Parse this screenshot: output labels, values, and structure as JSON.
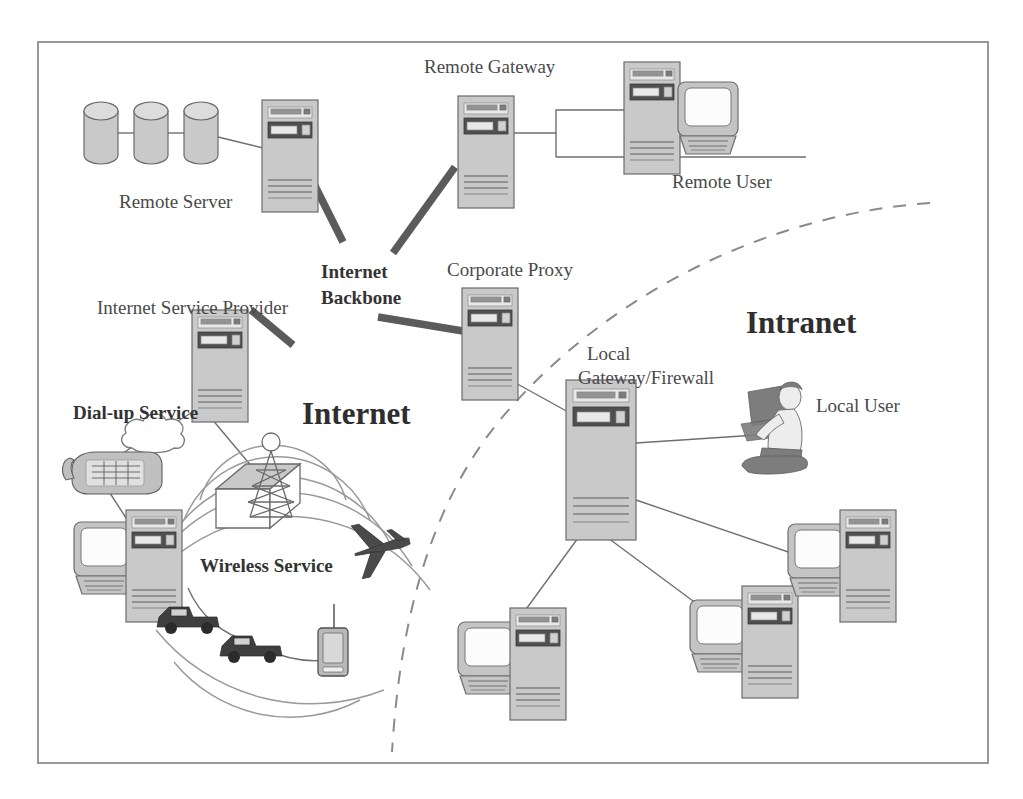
{
  "diagram": {
    "zones": [
      {
        "id": "internet",
        "label": "Internet"
      },
      {
        "id": "intranet",
        "label": "Intranet"
      }
    ],
    "labels": {
      "remote_server": "Remote Server",
      "remote_gateway": "Remote Gateway",
      "remote_user": "Remote User",
      "internet_backbone": "Internet",
      "internet_backbone2": "Backbone",
      "corporate_proxy": "Corporate Proxy",
      "isp": "Internet Service Provider",
      "dialup": "Dial-up Service",
      "wireless": "Wireless Service",
      "local_gateway": "Local",
      "local_gateway2": "Gateway/Firewall",
      "local_user": "Local User",
      "internet_zone": "Internet",
      "intranet_zone": "Intranet"
    },
    "nodes": [
      {
        "id": "disk-array",
        "name": "disk-array",
        "label": "Remote Server",
        "count": 3
      },
      {
        "id": "remote-server-tower",
        "name": "server-tower",
        "label": "Remote Server"
      },
      {
        "id": "remote-gateway-tower",
        "name": "server-tower",
        "label": "Remote Gateway"
      },
      {
        "id": "remote-user-workstation",
        "name": "workstation",
        "label": "Remote User"
      },
      {
        "id": "corporate-proxy-tower",
        "name": "server-tower",
        "label": "Corporate Proxy"
      },
      {
        "id": "isp-tower",
        "name": "server-tower",
        "label": "Internet Service Provider"
      },
      {
        "id": "dialup-cloud",
        "name": "cloud",
        "label": "Dial-up Service"
      },
      {
        "id": "telephone",
        "name": "telephone",
        "label": "Dial-up Service"
      },
      {
        "id": "dialup-workstation",
        "name": "workstation",
        "label": "Dial-up Service"
      },
      {
        "id": "radio-tower",
        "name": "radio-tower",
        "label": "Wireless Service"
      },
      {
        "id": "airplane",
        "name": "airplane",
        "label": "Wireless Service"
      },
      {
        "id": "vehicle-1",
        "name": "vehicle",
        "label": "Wireless Service"
      },
      {
        "id": "vehicle-2",
        "name": "vehicle",
        "label": "Wireless Service"
      },
      {
        "id": "mobile-phone",
        "name": "mobile-phone",
        "label": "Wireless Service"
      },
      {
        "id": "local-gateway-tower",
        "name": "firewall-tower",
        "label": "Local Gateway/Firewall"
      },
      {
        "id": "local-user-person",
        "name": "person-at-desk",
        "label": "Local User"
      },
      {
        "id": "intranet-workstation-1",
        "name": "workstation",
        "label": ""
      },
      {
        "id": "intranet-workstation-2",
        "name": "workstation",
        "label": ""
      },
      {
        "id": "intranet-workstation-3",
        "name": "workstation",
        "label": ""
      }
    ],
    "colors": {
      "device_fill": "#c9c9c9",
      "device_stroke": "#6c6c6c",
      "backbone": "#5b5b5b",
      "link": "#6f6f6f",
      "boundary": "#8a8a8a",
      "text": "#4a4a4a",
      "background": "#ffffff"
    }
  }
}
